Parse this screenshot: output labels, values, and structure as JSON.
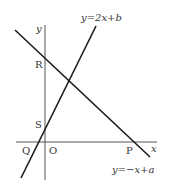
{
  "diagram": {
    "type": "coordinate-geometry",
    "axes": {
      "x_label": "x",
      "y_label": "y",
      "origin_label": "O"
    },
    "lines": [
      {
        "id": "line1",
        "equation": "y=2x+b",
        "color": "#1a1a1a"
      },
      {
        "id": "line2",
        "equation": "y=−x+a",
        "color": "#1a1a1a"
      }
    ],
    "points": [
      {
        "label": "R",
        "description": "y-intercept of y=−x+a"
      },
      {
        "label": "S",
        "description": "y-intercept of y=2x+b"
      },
      {
        "label": "Q",
        "description": "x-intercept of y=2x+b"
      },
      {
        "label": "P",
        "description": "x-intercept of y=−x+a"
      },
      {
        "label": "O",
        "description": "origin"
      }
    ],
    "labels": {
      "line1_eq": "y=2x+b",
      "line2_eq": "y=−x+a",
      "R": "R",
      "S": "S",
      "Q": "Q",
      "P": "P",
      "O": "O",
      "x": "x",
      "y": "y"
    }
  }
}
